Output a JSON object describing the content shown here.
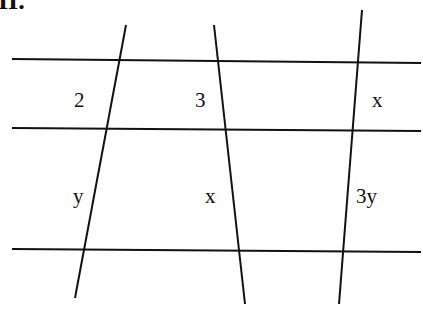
{
  "diagram": {
    "header_label": "II.",
    "stroke_color": "#111111",
    "horizontal_lines": [
      {
        "name": "top-parallel-line",
        "x1": 12,
        "y1": 59,
        "x2": 421,
        "y2": 63
      },
      {
        "name": "middle-parallel-line",
        "x1": 12,
        "y1": 128,
        "x2": 421,
        "y2": 131
      },
      {
        "name": "bottom-parallel-line",
        "x1": 12,
        "y1": 249,
        "x2": 421,
        "y2": 252
      }
    ],
    "transversals": [
      {
        "name": "left-transversal",
        "x1": 126,
        "y1": 25,
        "x2": 75,
        "y2": 298
      },
      {
        "name": "middle-transversal",
        "x1": 214,
        "y1": 25,
        "x2": 245,
        "y2": 304
      },
      {
        "name": "right-transversal",
        "x1": 362,
        "y1": 10,
        "x2": 339,
        "y2": 304
      }
    ],
    "segment_labels": [
      {
        "name": "label-left-top",
        "text": "2",
        "x": 74,
        "y": 90
      },
      {
        "name": "label-middle-top",
        "text": "3",
        "x": 195,
        "y": 90
      },
      {
        "name": "label-right-top",
        "text": "x",
        "x": 372,
        "y": 90
      },
      {
        "name": "label-left-bottom",
        "text": "y",
        "x": 73,
        "y": 186
      },
      {
        "name": "label-middle-bottom",
        "text": "x",
        "x": 205,
        "y": 186
      },
      {
        "name": "label-right-bottom",
        "text": "3y",
        "x": 356,
        "y": 186
      }
    ]
  }
}
